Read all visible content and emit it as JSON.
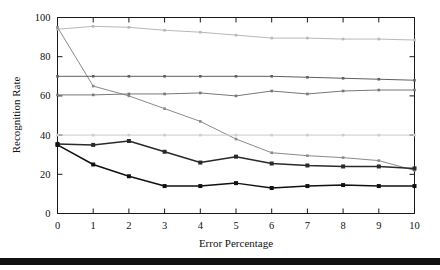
{
  "chart_data": {
    "type": "line",
    "title": "",
    "xlabel": "Error Percentage",
    "ylabel": "Recognition Rate",
    "xlim": [
      0,
      10
    ],
    "ylim": [
      0,
      100
    ],
    "xticks": [
      0,
      1,
      2,
      3,
      4,
      5,
      6,
      7,
      8,
      9,
      10
    ],
    "yticks": [
      0,
      20,
      40,
      60,
      80,
      100
    ],
    "grid": false,
    "legend": "none",
    "x": [
      0,
      1,
      2,
      3,
      4,
      5,
      6,
      7,
      8,
      9,
      10
    ],
    "series": [
      {
        "name": "series-1-top",
        "color": "#b8b8b8",
        "marker": "dot",
        "values": [
          94,
          95.5,
          95,
          93.5,
          92.5,
          91,
          89.5,
          89.5,
          89,
          89,
          88.5
        ]
      },
      {
        "name": "series-2-declining",
        "color": "#8a8a8a",
        "marker": "dot",
        "values": [
          95,
          65,
          60,
          53.5,
          47,
          38,
          31,
          29.5,
          28.5,
          27,
          22
        ]
      },
      {
        "name": "series-3-flat-70",
        "color": "#606060",
        "marker": "dot",
        "values": [
          70,
          70,
          70,
          70,
          70,
          70,
          70,
          69.5,
          69,
          68.5,
          68
        ]
      },
      {
        "name": "series-4-flat-60",
        "color": "#777777",
        "marker": "dot",
        "values": [
          60.5,
          60.5,
          61,
          61,
          61.5,
          60,
          62.5,
          61,
          62.5,
          63,
          63
        ]
      },
      {
        "name": "series-5-flat-40",
        "color": "#cccccc",
        "marker": "dot",
        "values": [
          40,
          40,
          40,
          40,
          40,
          40,
          40,
          40,
          40,
          40,
          40
        ]
      },
      {
        "name": "series-6-mid",
        "color": "#2a2a2a",
        "marker": "square",
        "values": [
          35.5,
          35,
          37,
          31.5,
          26,
          29,
          25.5,
          24.5,
          24,
          24,
          23
        ]
      },
      {
        "name": "series-7-bottom",
        "color": "#111111",
        "marker": "square",
        "values": [
          35,
          25,
          19,
          14,
          14,
          15.5,
          13,
          14,
          14.5,
          14,
          14
        ]
      }
    ]
  },
  "footer": {
    "rule": ""
  }
}
